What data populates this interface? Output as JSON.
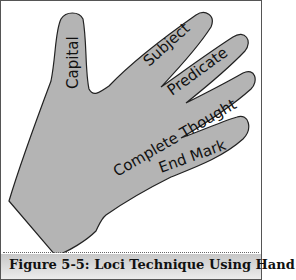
{
  "figure": {
    "labels": {
      "thumb": "Capital",
      "index": "Subject",
      "middle": "Predicate",
      "ring": "Complete Thought",
      "pinky": "End Mark"
    },
    "colors": {
      "hand_fill": "#b4b4b4",
      "hand_stroke": "#222222",
      "caption_bg": "#d6d6d6"
    }
  },
  "caption": "Figure 5-5: Loci Technique Using Hand"
}
